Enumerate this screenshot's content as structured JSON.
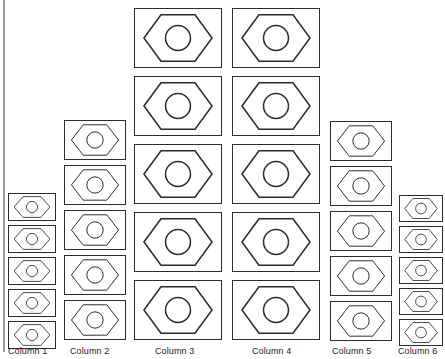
{
  "diagram": {
    "icon_name": "hex-nut-icon",
    "background_color": "#ffffff",
    "stroke_color": "#2b2b2b",
    "axis_color": "#9a9a9a"
  },
  "axis": {
    "name": "left-axis-line",
    "visible": true
  },
  "chart_data": {
    "type": "bar",
    "title": "",
    "xlabel": "",
    "ylabel": "",
    "categories": [
      "Column 1",
      "Column 2",
      "Column 3",
      "Column 4",
      "Column 5",
      "Column 6"
    ],
    "values": [
      5,
      5,
      5,
      5,
      5,
      5
    ],
    "unit": "hex-nut icons",
    "grid": false,
    "legend": false,
    "note": "Each column stacks 5 hex-nut icons; icon size varies per column forming a pyramid silhouette"
  },
  "columns": [
    {
      "id": "column-1",
      "label": "Column 1",
      "count": 5,
      "cell_width": 48,
      "cell_height": 28,
      "gap": 4,
      "left": 8,
      "top": 193,
      "label_left": 8,
      "label_top": 346
    },
    {
      "id": "column-2",
      "label": "Column 2",
      "count": 5,
      "cell_width": 62,
      "cell_height": 40,
      "gap": 5,
      "left": 64,
      "top": 120,
      "label_left": 70,
      "label_top": 346
    },
    {
      "id": "column-3",
      "label": "Column 3",
      "count": 5,
      "cell_width": 88,
      "cell_height": 60,
      "gap": 8,
      "left": 134,
      "top": 8,
      "label_left": 155,
      "label_top": 346
    },
    {
      "id": "column-4",
      "label": "Column 4",
      "count": 5,
      "cell_width": 88,
      "cell_height": 60,
      "gap": 8,
      "left": 232,
      "top": 8,
      "label_left": 252,
      "label_top": 346
    },
    {
      "id": "column-5",
      "label": "Column 5",
      "count": 5,
      "cell_width": 62,
      "cell_height": 40,
      "gap": 5,
      "left": 330,
      "top": 121,
      "label_left": 332,
      "label_top": 346
    },
    {
      "id": "column-6",
      "label": "Column 6",
      "count": 5,
      "cell_width": 44,
      "cell_height": 27,
      "gap": 4,
      "left": 399,
      "top": 195,
      "label_left": 398,
      "label_top": 346
    }
  ]
}
